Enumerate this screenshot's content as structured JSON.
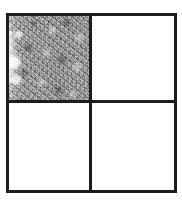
{
  "figure": {
    "title": "Two-by-two quadrant grid with a single textured cell",
    "background_color": "#ffffff",
    "border_color": "#1c1c1c",
    "border_width_px": 3,
    "frame": {
      "left_px": 6,
      "top_px": 13,
      "width_px": 171,
      "height_px": 180
    },
    "grid": {
      "rows": 2,
      "columns": 2
    }
  },
  "quadrants": [
    {
      "id": "top-left",
      "position": "top-left",
      "fill": "texture",
      "fill_label": "mottled gray noise",
      "fill_color": "#9b9b9b",
      "note": "lighter vertical streak along the left edge"
    },
    {
      "id": "top-right",
      "position": "top-right",
      "fill": "empty",
      "fill_label": "white",
      "fill_color": "#ffffff",
      "note": ""
    },
    {
      "id": "bottom-left",
      "position": "bottom-left",
      "fill": "empty",
      "fill_label": "white",
      "fill_color": "#ffffff",
      "note": ""
    },
    {
      "id": "bottom-right",
      "position": "bottom-right",
      "fill": "empty",
      "fill_label": "white",
      "fill_color": "#ffffff",
      "note": ""
    }
  ]
}
